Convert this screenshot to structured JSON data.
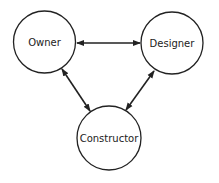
{
  "diagram": {
    "title": "",
    "nodes": [
      {
        "id": "owner",
        "label": "Owner",
        "cx": 44.5,
        "cy": 42,
        "r": 31
      },
      {
        "id": "designer",
        "label": "Designer",
        "cx": 172,
        "cy": 43,
        "r": 31
      },
      {
        "id": "constructor",
        "label": "Constructor",
        "cx": 109,
        "cy": 138,
        "r": 32
      }
    ],
    "edges": [
      {
        "from": "owner",
        "to": "designer",
        "type": "bidirectional"
      },
      {
        "from": "owner",
        "to": "constructor",
        "type": "bidirectional"
      },
      {
        "from": "designer",
        "to": "constructor",
        "type": "bidirectional"
      }
    ],
    "colors": {
      "stroke": "#222222",
      "background": "#ffffff"
    }
  }
}
